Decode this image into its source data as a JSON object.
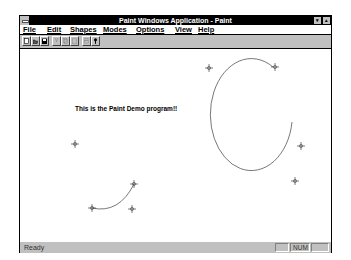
{
  "window": {
    "title": "Paint Windows Application - Paint",
    "minimize_glyph": "▾",
    "maximize_glyph": "▴"
  },
  "menubar": {
    "items": [
      {
        "label": "File",
        "x": 3
      },
      {
        "label": "Edit",
        "x": 27
      },
      {
        "label": "Shapes",
        "x": 50
      },
      {
        "label": "Modes",
        "x": 83
      },
      {
        "label": "Options",
        "x": 116
      },
      {
        "label": "View",
        "x": 155
      },
      {
        "label": "Help",
        "x": 178
      }
    ]
  },
  "toolbar": {
    "buttons": [
      {
        "name": "new-file-button",
        "icon": "new-file-icon",
        "enabled": true,
        "x": 2
      },
      {
        "name": "open-file-button",
        "icon": "open-folder-icon",
        "enabled": true,
        "x": 11
      },
      {
        "name": "save-file-button",
        "icon": "save-disk-icon",
        "enabled": true,
        "x": 20
      },
      {
        "name": "cut-button",
        "icon": "scissors-icon",
        "enabled": false,
        "x": 32
      },
      {
        "name": "copy-button",
        "icon": "copy-icon",
        "enabled": false,
        "x": 41
      },
      {
        "name": "paste-button",
        "icon": "paste-icon",
        "enabled": false,
        "x": 50
      },
      {
        "name": "print-button",
        "icon": "printer-icon",
        "enabled": false,
        "x": 62
      },
      {
        "name": "help-button",
        "icon": "help-question-icon",
        "enabled": true,
        "x": 71
      }
    ]
  },
  "canvas": {
    "text": "This is the Paint Demo program!!",
    "large_arc": {
      "path": "M 253 53 A 41 55 0 1 0 272 111",
      "control_points": [
        [
          189,
          53
        ],
        [
          255,
          51
        ],
        [
          281,
          129
        ],
        [
          274,
          165
        ]
      ]
    },
    "small_arc": {
      "path": "M 72 191 Q 100 198 115 168",
      "control_points": [
        [
          53,
          128
        ],
        [
          115,
          168
        ],
        [
          72,
          191
        ],
        [
          112,
          192
        ]
      ]
    },
    "stroke_color": "#555555"
  },
  "statusbar": {
    "text": "Ready",
    "panels": [
      {
        "label": "",
        "x": 255,
        "width": 14
      },
      {
        "label": "NUM",
        "x": 270,
        "width": 20
      },
      {
        "label": "",
        "x": 291,
        "width": 18
      }
    ]
  }
}
